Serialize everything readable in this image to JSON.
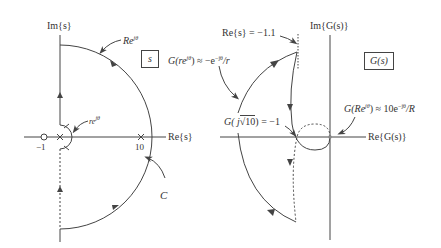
{
  "s_plane": {
    "title_box": "s",
    "im_axis_label": "Im{s}",
    "re_axis_label": "Re{s}",
    "large_arc_label": "Re",
    "large_arc_label_sup": "jθ",
    "small_arc_label": "re",
    "small_arc_label_sup": "jθ",
    "contour_label": "C",
    "zero_label": "−1",
    "pole_label": "10",
    "markers": [
      {
        "type": "zero",
        "at": -1
      },
      {
        "type": "pole",
        "at": 0
      },
      {
        "type": "pole",
        "at": 10
      }
    ]
  },
  "g_plane": {
    "title_box": "G(s)",
    "im_axis_label": "Im{G(s)}",
    "re_axis_label": "Re{G(s)}",
    "asymptote_label": "Re{s} = −1.1",
    "small_r_mapping_pre": "G(re",
    "small_r_mapping_sup": "jθ",
    "small_r_mapping_post": ") ≈ −e",
    "small_r_mapping_sup2": "−jθ",
    "small_r_mapping_tail": "/r",
    "crossing_label_pre": "G( j",
    "crossing_label_sqrt": "10",
    "crossing_label_post": ") = −1",
    "large_R_mapping_pre": "G(Re",
    "large_R_mapping_sup": "jθ",
    "large_R_mapping_post": ") ≈ 10e",
    "large_R_mapping_sup2": "−jθ",
    "large_R_mapping_tail": "/R"
  },
  "colors": {
    "line": "#444444",
    "background": "#ffffff"
  }
}
